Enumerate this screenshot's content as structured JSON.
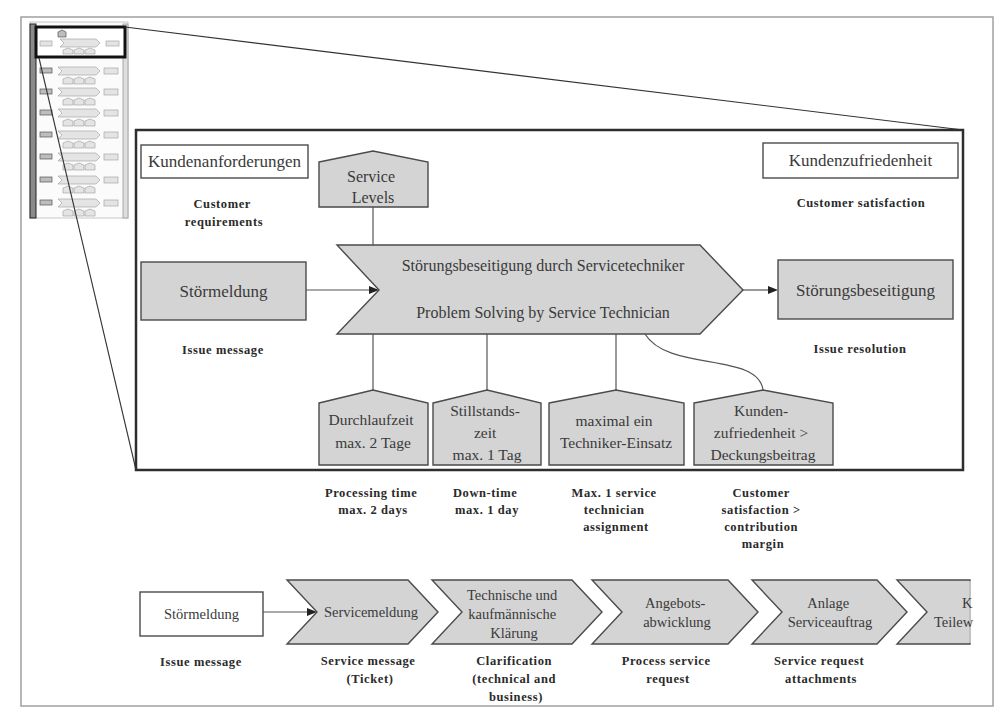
{
  "diagram": {
    "detail": {
      "customer_requirements": {
        "label_de": "Kundenanforderungen",
        "label_en": [
          "Customer",
          "requirements"
        ]
      },
      "service_levels": {
        "label_de": [
          "Service",
          "Levels"
        ]
      },
      "customer_satisfaction": {
        "label_de": "Kundenzufriedenheit",
        "label_en": "Customer satisfaction"
      },
      "input_event": {
        "label_de": "Störmeldung",
        "label_en": "Issue message"
      },
      "process": {
        "label_de": "Störungsbeseitigung durch Servicetechniker",
        "label_en": "Problem Solving by Service Technician"
      },
      "output_event": {
        "label_de": "Störungsbeseitigung",
        "label_en": "Issue resolution"
      },
      "service_level_items": [
        {
          "label_de": [
            "Durchlaufzeit",
            "max. 2 Tage"
          ],
          "label_en": [
            "Processing time",
            "max. 2 days"
          ]
        },
        {
          "label_de": [
            "Stillstands-",
            "zeit",
            "max. 1 Tag"
          ],
          "label_en": [
            "Down-time",
            "max. 1 day"
          ]
        },
        {
          "label_de": [
            "maximal ein",
            "Techniker-Einsatz"
          ],
          "label_en": [
            "Max. 1 service",
            "technician",
            "assignment"
          ]
        },
        {
          "label_de": [
            "Kunden-",
            "zufriedenheit >",
            "Deckungsbeitrag"
          ],
          "label_en": [
            "Customer",
            "satisfaction >",
            "contribution",
            "margin"
          ]
        }
      ]
    },
    "process_chain": {
      "start_event": {
        "label_de": "Störmeldung",
        "label_en": "Issue message"
      },
      "steps": [
        {
          "label_de": [
            "Servicemeldung"
          ],
          "label_en": [
            "Service message",
            "(Ticket)"
          ]
        },
        {
          "label_de": [
            "Technische und",
            "kaufmännische",
            "Klärung"
          ],
          "label_en": [
            "Clarification",
            "(technical and",
            "business)"
          ]
        },
        {
          "label_de": [
            "Angebots-",
            "abwicklung"
          ],
          "label_en": [
            "Process service",
            "request"
          ]
        },
        {
          "label_de": [
            "Anlage",
            "Serviceauftrag"
          ],
          "label_en": [
            "Service request",
            "attachments"
          ]
        },
        {
          "label_de": [
            "K",
            "Teilew"
          ],
          "label_en": []
        }
      ]
    }
  },
  "colors": {
    "shape_fill": "#d4d4d4",
    "stroke": "#4a4a4a",
    "frame": "#a0a0a0",
    "detail_border": "#2e2e2e",
    "background": "#ffffff"
  }
}
